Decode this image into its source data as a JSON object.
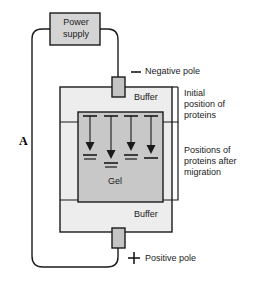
{
  "figure": {
    "type": "diagram",
    "background_color": "#ffffff",
    "stroke_color": "#1a1a1a",
    "box_fill_color": "#d0d0d0",
    "gel_fill_color": "#c8c8c8",
    "buffer_fill_color": "#ededed",
    "electrode_fill_color": "#c4c4c4"
  },
  "power_supply": {
    "line1": "Power",
    "line2": "supply"
  },
  "poles": {
    "negative": {
      "sign": "—",
      "label": "Negative pole"
    },
    "positive": {
      "sign": "+",
      "label": "Positive pole"
    }
  },
  "tank": {
    "buffer_top_label": "Buffer",
    "buffer_bottom_label": "Buffer",
    "gel_label": "Gel"
  },
  "annotations": {
    "circuit_label": "A",
    "initial_position": {
      "line1": "Initial",
      "line2": "position of",
      "line3": "proteins"
    },
    "after_migration": {
      "line1": "Positions of",
      "line2": "proteins after",
      "line3": "migration"
    }
  },
  "proteins": {
    "count": 4,
    "start_y": 116,
    "bands": [
      {
        "x": 90,
        "start_y": 116,
        "end_y": 151,
        "label": "protein-band-1"
      },
      {
        "x": 111,
        "start_y": 116,
        "end_y": 159,
        "label": "protein-band-2"
      },
      {
        "x": 131,
        "start_y": 116,
        "end_y": 151,
        "label": "protein-band-3"
      },
      {
        "x": 151,
        "start_y": 116,
        "end_y": 154,
        "label": "protein-band-4"
      }
    ]
  }
}
